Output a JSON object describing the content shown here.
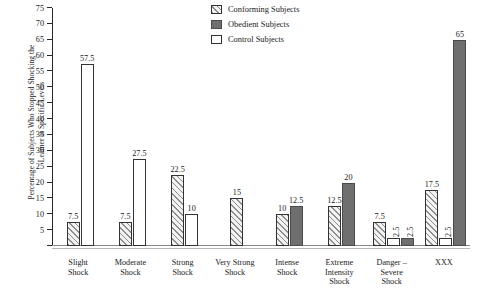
{
  "chart_data": {
    "type": "bar",
    "title": "",
    "xlabel": "",
    "ylabel": "Percentage of Subjects Who Stopped Shocking the Learner at Specific Levels",
    "ylabel_lines": [
      "Percentage of Subjects Who Stopped Shocking the",
      "Learner at Specific Levels"
    ],
    "ylim": [
      0,
      75
    ],
    "ytick_step": 5,
    "yticks": [
      0,
      5,
      10,
      15,
      20,
      25,
      30,
      35,
      40,
      45,
      50,
      55,
      60,
      65,
      70,
      75
    ],
    "ytick_labels": [
      "",
      "5",
      "10",
      "15",
      "20",
      "25",
      "30",
      "35",
      "40",
      "45",
      "50",
      "55",
      "60",
      "65",
      "70",
      "75"
    ],
    "grid": false,
    "legend_position": "top-right",
    "categories": [
      "Slight Shock",
      "Moderate Shock",
      "Strong Shock",
      "Very Strong Shock",
      "Intense Shock",
      "Extreme Intensity Shock",
      "Danger - Severe Shock",
      "XXX"
    ],
    "category_lines": [
      [
        "Slight",
        "Shock"
      ],
      [
        "Moderate",
        "Shock"
      ],
      [
        "Strong",
        "Shock"
      ],
      [
        "Very Strong",
        "Shock"
      ],
      [
        "Intense",
        "Shock"
      ],
      [
        "Extreme",
        "Intensity",
        "Shock"
      ],
      [
        "Danger –",
        "Severe",
        "Shock"
      ],
      [
        "XXX"
      ]
    ],
    "series": [
      {
        "name": "Conforming Subjects",
        "style": "hatched",
        "color": "#f2f2f2",
        "values": [
          7.5,
          7.5,
          22.5,
          15,
          10,
          12.5,
          7.5,
          17.5
        ],
        "labels": [
          "7.5",
          "7.5",
          "22.5",
          "15",
          "10",
          "12.5",
          "7.5",
          "17.5"
        ]
      },
      {
        "name": "Control Subjects",
        "style": "open",
        "color": "#ffffff",
        "values": [
          57.5,
          27.5,
          10,
          null,
          null,
          null,
          2.5,
          2.5
        ],
        "labels": [
          "57.5",
          "27.5",
          "10",
          "",
          "",
          "",
          "2.5",
          "2.5"
        ]
      },
      {
        "name": "Obedient Subjects",
        "style": "solid",
        "color": "#6f6f6f",
        "values": [
          null,
          null,
          null,
          null,
          12.5,
          20,
          2.5,
          65
        ],
        "labels": [
          "",
          "",
          "",
          "",
          "12.5",
          "20",
          "2.5",
          "65"
        ]
      }
    ]
  },
  "legend": {
    "items": [
      {
        "label": "Conforming Subjects",
        "swatch": "hatched"
      },
      {
        "label": "Obedient Subjects",
        "swatch": "solid"
      },
      {
        "label": "Control Subjects",
        "swatch": "open"
      }
    ]
  }
}
